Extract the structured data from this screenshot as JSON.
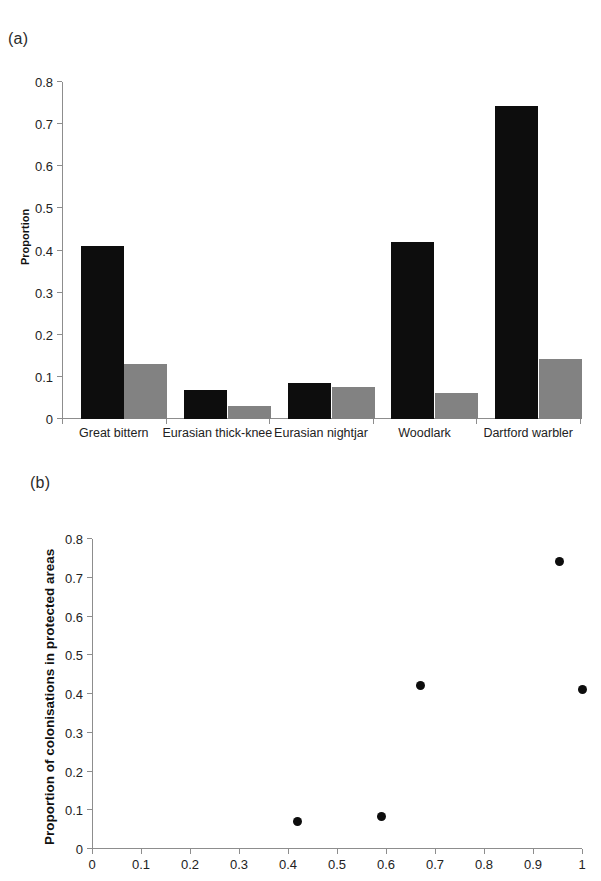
{
  "figure": {
    "panel_a_label": "(a)",
    "panel_b_label": "(b)"
  },
  "chart_data": [
    {
      "id": "panel-a",
      "type": "bar",
      "title": "",
      "xlabel": "",
      "ylabel": "Proportion",
      "ylim": [
        0,
        0.8
      ],
      "yticks": [
        "0",
        "0.1",
        "0.2",
        "0.3",
        "0.4",
        "0.5",
        "0.6",
        "0.7",
        "0.8"
      ],
      "ytick_values": [
        0,
        0.1,
        0.2,
        0.3,
        0.4,
        0.5,
        0.6,
        0.7,
        0.8
      ],
      "grid": false,
      "legend": "none",
      "categories": [
        "Great bittern",
        "Eurasian thick-knee",
        "Eurasian nightjar",
        "Woodlark",
        "Dartford warbler"
      ],
      "series": [
        {
          "name": "black",
          "color": "#0d0d0d",
          "values": [
            0.41,
            0.07,
            0.085,
            0.42,
            0.742
          ]
        },
        {
          "name": "grey",
          "color": "#828282",
          "values": [
            0.13,
            0.03,
            0.077,
            0.061,
            0.142
          ]
        }
      ]
    },
    {
      "id": "panel-b",
      "type": "scatter",
      "title": "",
      "xlabel": "",
      "ylabel": "Proportion of colonisations in protected areas",
      "xlim": [
        0,
        1
      ],
      "ylim": [
        0,
        0.8
      ],
      "xticks": [
        "0",
        "0.1",
        "0.2",
        "0.3",
        "0.4",
        "0.5",
        "0.6",
        "0.7",
        "0.8",
        "0.9",
        "1"
      ],
      "xtick_values": [
        0,
        0.1,
        0.2,
        0.3,
        0.4,
        0.5,
        0.6,
        0.7,
        0.8,
        0.9,
        1
      ],
      "yticks": [
        "0",
        "0.1",
        "0.2",
        "0.3",
        "0.4",
        "0.5",
        "0.6",
        "0.7",
        "0.8"
      ],
      "ytick_values": [
        0,
        0.1,
        0.2,
        0.3,
        0.4,
        0.5,
        0.6,
        0.7,
        0.8
      ],
      "grid": false,
      "legend": "none",
      "marker": "filled-circle",
      "marker_color": "#0d0d0d",
      "points": [
        {
          "x": 0.42,
          "y": 0.071
        },
        {
          "x": 0.59,
          "y": 0.085
        },
        {
          "x": 0.67,
          "y": 0.422
        },
        {
          "x": 0.955,
          "y": 0.742
        },
        {
          "x": 1.0,
          "y": 0.412
        }
      ]
    }
  ]
}
